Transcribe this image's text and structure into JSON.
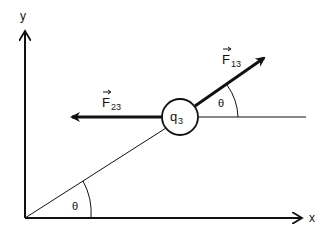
{
  "diagram": {
    "axes": {
      "x_label": "x",
      "y_label": "y"
    },
    "charge": {
      "label": "q",
      "subscript": "3"
    },
    "forces": [
      {
        "name": "F",
        "subscript": "13",
        "direction": "along line, up-right at angle theta"
      },
      {
        "name": "F",
        "subscript": "23",
        "direction": "horizontal, to the left"
      }
    ],
    "angles": [
      {
        "label": "θ",
        "location": "at origin between x-axis and line"
      },
      {
        "label": "θ",
        "location": "at q3 between horizontal and F13"
      }
    ],
    "colors": {
      "stroke": "#111111",
      "background": "#ffffff"
    }
  }
}
